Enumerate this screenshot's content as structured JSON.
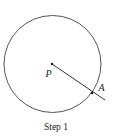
{
  "diagram": {
    "caption": "Step 1",
    "circle": {
      "cx": 52.5,
      "cy": 64,
      "r": 48.5,
      "stroke": "#555555"
    },
    "center_point": {
      "label": "P",
      "x": 52,
      "y": 64
    },
    "point_on_circle": {
      "label": "A",
      "x": 92,
      "y": 93
    },
    "ray": {
      "x1": 52,
      "y1": 64,
      "x2": 105,
      "y2": 100
    }
  }
}
